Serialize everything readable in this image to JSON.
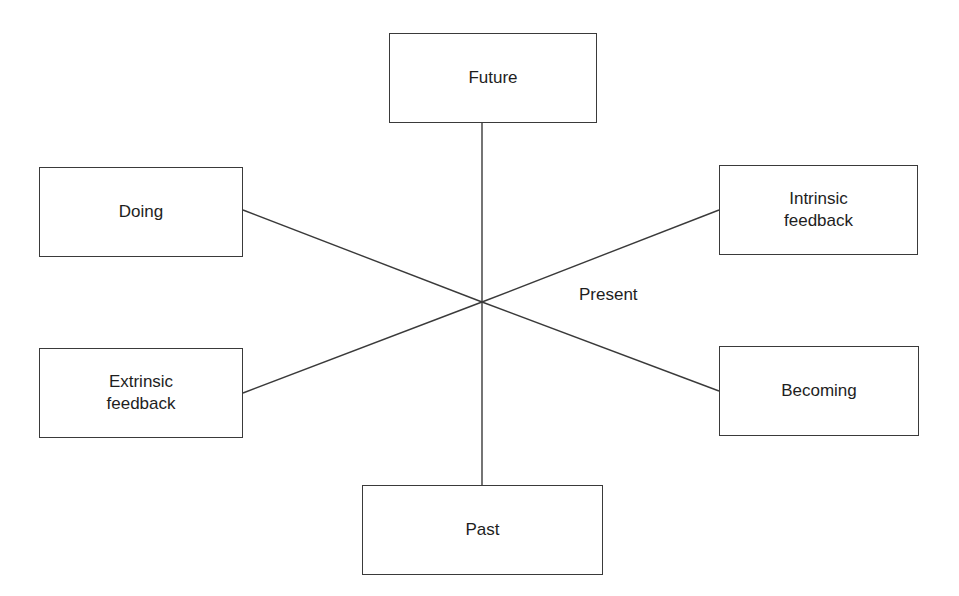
{
  "diagram": {
    "type": "radial-concept",
    "center": {
      "label": "Present",
      "hub": [
        482,
        302
      ],
      "label_pos": [
        579,
        284
      ]
    },
    "nodes": [
      {
        "id": "future",
        "label": "Future",
        "box": [
          389,
          33,
          208,
          90
        ],
        "anchor": [
          482,
          123
        ]
      },
      {
        "id": "doing",
        "label": "Doing",
        "box": [
          39,
          167,
          204,
          90
        ],
        "anchor": [
          243,
          210
        ]
      },
      {
        "id": "intrinsic",
        "label": "Intrinsic\nfeedback",
        "box": [
          719,
          165,
          199,
          90
        ],
        "anchor": [
          719,
          210
        ]
      },
      {
        "id": "extrinsic",
        "label": "Extrinsic\nfeedback",
        "box": [
          39,
          348,
          204,
          90
        ],
        "anchor": [
          243,
          393
        ]
      },
      {
        "id": "becoming",
        "label": "Becoming",
        "box": [
          719,
          346,
          200,
          90
        ],
        "anchor": [
          719,
          391
        ]
      },
      {
        "id": "past",
        "label": "Past",
        "box": [
          362,
          485,
          241,
          90
        ],
        "anchor": [
          482,
          485
        ]
      }
    ],
    "colors": {
      "line": "#3a3a3a",
      "box_border": "#3a3a3a",
      "text": "#1e1e1e",
      "background": "#ffffff"
    }
  }
}
